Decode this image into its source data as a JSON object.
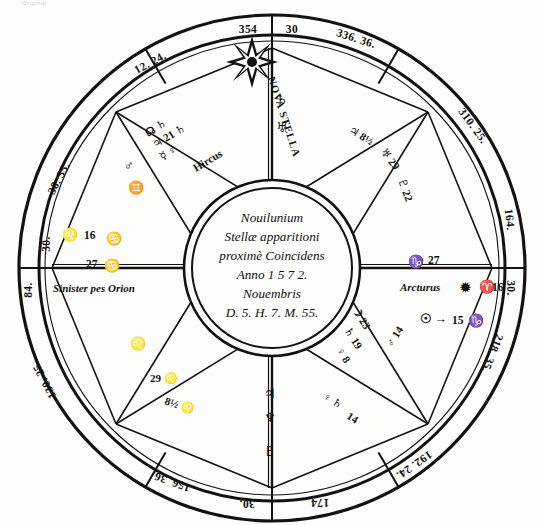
{
  "page": {
    "scan_header": "Original"
  },
  "center": {
    "lines": [
      "Nouilunium",
      "Stellæ apparitioni",
      "proximè Coincidens",
      "Anno 1 5 7 2.",
      "Nouembris",
      "D. 5. H. 7. M. 55."
    ]
  },
  "outer_ring": {
    "labels": [
      {
        "text": "354",
        "name": "ring-label-354"
      },
      {
        "text": "30",
        "name": "ring-label-30-top"
      },
      {
        "text": "336. 36.",
        "name": "ring-label-336-36"
      },
      {
        "text": "310. 25.",
        "name": "ring-label-310-25"
      },
      {
        "text": "164.",
        "name": "ring-label-164"
      },
      {
        "text": "30.",
        "name": "ring-label-30-right"
      },
      {
        "text": "218. 35.",
        "name": "ring-label-218-35"
      },
      {
        "text": "192. 24.",
        "name": "ring-label-192-24"
      },
      {
        "text": "174",
        "name": "ring-label-174"
      },
      {
        "text": "30.",
        "name": "ring-label-30-bottom"
      },
      {
        "text": "156. 36.",
        "name": "ring-label-156-36"
      },
      {
        "text": "130. 25.",
        "name": "ring-label-130-25"
      },
      {
        "text": "84.",
        "name": "ring-label-84"
      },
      {
        "text": "30.",
        "name": "ring-label-30-left"
      },
      {
        "text": "38. 35.",
        "name": "ring-label-38-35"
      },
      {
        "text": "12. 24.",
        "name": "ring-label-12-24"
      }
    ]
  },
  "stars": {
    "nova": {
      "label": "NOVA STELLA",
      "name": "nova-stella-label"
    },
    "orion": {
      "label": "Sinister pes Orion",
      "sign_glyph": "♌",
      "sign_degree": "16",
      "cusp_degree": "27",
      "cusp_glyph": "♋"
    },
    "arcturus": {
      "label": "Arcturus",
      "cusp_degree": "27",
      "cusp_glyph": "♑",
      "star_glyph": "✹",
      "sign_glyph": "♈",
      "sign_degree": "16"
    },
    "hircus": {
      "label": "Hircus"
    }
  },
  "sun_note": {
    "glyph": "☉",
    "arrow": "→",
    "degree": "15",
    "sign_glyph": "♑"
  },
  "planet_clusters": {
    "upper_left": {
      "name": "planet-cluster-upper-left",
      "rows": [
        {
          "glyphs": "☊ ♄",
          "degree": ""
        },
        {
          "glyphs": "♃ 21 ♄",
          "degree": "21"
        },
        {
          "glyphs": "☿ ♀",
          "degree": ""
        }
      ],
      "gemini_glyph": "♊",
      "mars_glyph": "♂"
    },
    "upper_right": {
      "name": "planet-cluster-upper-right",
      "rows": [
        {
          "glyphs": "♃ 8½"
        },
        {
          "glyphs": "♅ 29"
        },
        {
          "glyphs": "♇ 22"
        }
      ]
    },
    "lower_right": {
      "name": "planet-cluster-lower-right",
      "rows": [
        {
          "glyphs": "☽ 23"
        },
        {
          "glyphs": "♄ 19"
        },
        {
          "glyphs": "♀ 8"
        },
        {
          "glyphs": "♂ 14"
        }
      ]
    },
    "lower_left": {
      "name": "planet-cluster-lower-left",
      "rows": [
        {
          "glyphs": "♌"
        },
        {
          "glyphs": "29 ♌"
        },
        {
          "glyphs": "8½ ♌"
        }
      ]
    },
    "bottom": {
      "name": "planet-cluster-bottom",
      "rows": [
        {
          "glyphs": "♀ ♄"
        },
        {
          "glyphs": "14"
        }
      ]
    }
  },
  "colors": {
    "ink": "#141210",
    "paper": "#fdfdfb"
  }
}
